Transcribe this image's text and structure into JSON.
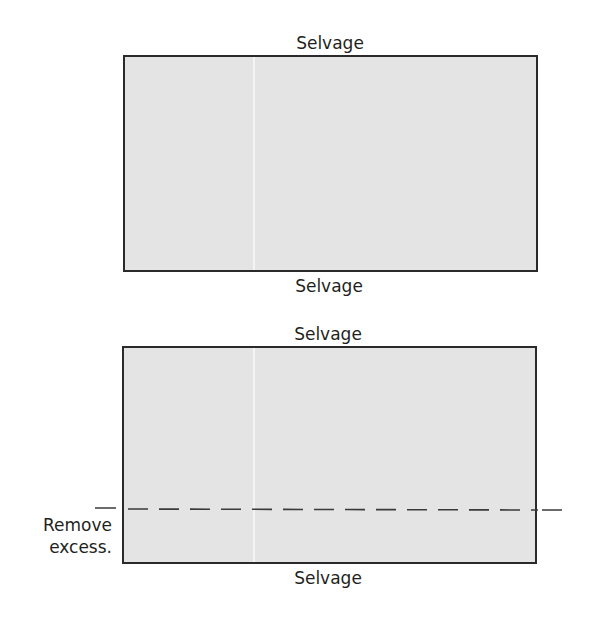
{
  "diagram": {
    "panel_top": {
      "label_top": "Selvage",
      "label_bottom": "Selvage"
    },
    "panel_bottom": {
      "label_top": "Selvage",
      "label_bottom": "Selvage",
      "cut_line_label_line1": "Remove",
      "cut_line_label_line2": "excess."
    },
    "colors": {
      "fabric_fill": "#e4e4e4",
      "outline": "#2a2a2a",
      "fold_line": "#f4f4f4",
      "text": "#231f20"
    }
  }
}
